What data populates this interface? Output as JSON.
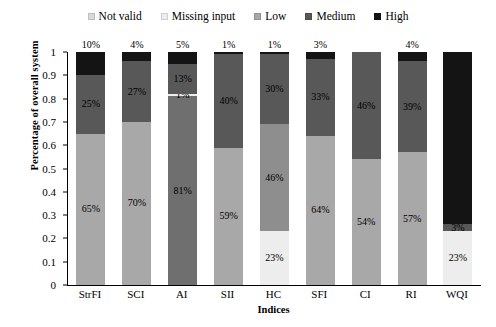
{
  "chart_data": {
    "type": "bar",
    "subtype": "stacked-column-100",
    "title": "",
    "xlabel": "Indices",
    "ylabel": "Percentage of overall system",
    "ylim": [
      0,
      1
    ],
    "ytick_labels": [
      "0",
      "0.1",
      "0.2",
      "0.3",
      "0.4",
      "0.5",
      "0.6",
      "0.7",
      "0.8",
      "0.9",
      "1"
    ],
    "ytick_values": [
      0,
      0.1,
      0.2,
      0.3,
      0.4,
      0.5,
      0.6,
      0.7,
      0.8,
      0.9,
      1
    ],
    "grid": false,
    "legend_position": "top-center",
    "categories": [
      "StrFI",
      "SCI",
      "AI",
      "SII",
      "HC",
      "SFI",
      "CI",
      "RI",
      "WQI"
    ],
    "series": [
      {
        "name": "Not valid",
        "color": "#d9d9d9",
        "values": [
          0,
          0,
          0,
          0,
          0,
          0,
          0,
          0,
          0
        ]
      },
      {
        "name": "Missing input",
        "color": "#ededed",
        "values": [
          0,
          0,
          1,
          0,
          23,
          0,
          0,
          0,
          23
        ]
      },
      {
        "name": "Low",
        "color": "#a8a8a8",
        "values": [
          65,
          70,
          81,
          59,
          46,
          64,
          54,
          57,
          0
        ]
      },
      {
        "name": "Medium",
        "color": "#585858",
        "values": [
          25,
          27,
          13,
          40,
          30,
          33,
          46,
          39,
          3
        ]
      },
      {
        "name": "High",
        "color": "#141414",
        "values": [
          10,
          4,
          5,
          1,
          1,
          3,
          0,
          4,
          74
        ]
      }
    ],
    "bars": [
      {
        "category": "StrFI",
        "top_label": "10%",
        "segments": [
          {
            "series": "Low",
            "value": 65,
            "label": "65%",
            "color": "#a8a8a8",
            "label_color": "dark"
          },
          {
            "series": "Medium",
            "value": 25,
            "label": "25%",
            "color": "#585858",
            "label_color": "dark"
          },
          {
            "series": "High",
            "value": 10,
            "label": "",
            "color": "#141414",
            "label_color": "onblack"
          }
        ]
      },
      {
        "category": "SCI",
        "top_label": "4%",
        "segments": [
          {
            "series": "Low",
            "value": 70,
            "label": "70%",
            "color": "#a8a8a8",
            "label_color": "dark"
          },
          {
            "series": "Medium",
            "value": 26,
            "label": "27%",
            "color": "#585858",
            "label_color": "dark"
          },
          {
            "series": "High",
            "value": 4,
            "label": "",
            "color": "#141414",
            "label_color": "onblack"
          }
        ]
      },
      {
        "category": "AI",
        "top_label": "5%",
        "segments": [
          {
            "series": "Low",
            "value": 81,
            "label": "81%",
            "color": "#6f6f6f",
            "label_color": "dark"
          },
          {
            "series": "Missing input",
            "value": 1,
            "label": "1%",
            "color": "#ededed",
            "label_color": "dark"
          },
          {
            "series": "Medium",
            "value": 13,
            "label": "13%",
            "color": "#585858",
            "label_color": "dark"
          },
          {
            "series": "High",
            "value": 5,
            "label": "",
            "color": "#141414",
            "label_color": "onblack"
          }
        ]
      },
      {
        "category": "SII",
        "top_label": "1%",
        "segments": [
          {
            "series": "Low",
            "value": 59,
            "label": "59%",
            "color": "#a8a8a8",
            "label_color": "dark"
          },
          {
            "series": "Medium",
            "value": 40,
            "label": "40%",
            "color": "#585858",
            "label_color": "dark"
          },
          {
            "series": "High",
            "value": 1,
            "label": "",
            "color": "#141414",
            "label_color": "onblack"
          }
        ]
      },
      {
        "category": "HC",
        "top_label": "1%",
        "segments": [
          {
            "series": "Missing input",
            "value": 23,
            "label": "23%",
            "color": "#ededed",
            "label_color": "dark"
          },
          {
            "series": "Low",
            "value": 46,
            "label": "46%",
            "color": "#8e8e8e",
            "label_color": "dark"
          },
          {
            "series": "Medium",
            "value": 30,
            "label": "30%",
            "color": "#585858",
            "label_color": "dark"
          },
          {
            "series": "High",
            "value": 1,
            "label": "",
            "color": "#141414",
            "label_color": "onblack"
          }
        ]
      },
      {
        "category": "SFI",
        "top_label": "3%",
        "segments": [
          {
            "series": "Low",
            "value": 64,
            "label": "64%",
            "color": "#a8a8a8",
            "label_color": "dark"
          },
          {
            "series": "Medium",
            "value": 33,
            "label": "33%",
            "color": "#585858",
            "label_color": "dark"
          },
          {
            "series": "High",
            "value": 3,
            "label": "",
            "color": "#141414",
            "label_color": "onblack"
          }
        ]
      },
      {
        "category": "CI",
        "top_label": "",
        "segments": [
          {
            "series": "Low",
            "value": 54,
            "label": "54%",
            "color": "#a8a8a8",
            "label_color": "dark"
          },
          {
            "series": "Medium",
            "value": 46,
            "label": "46%",
            "color": "#585858",
            "label_color": "dark"
          }
        ]
      },
      {
        "category": "RI",
        "top_label": "4%",
        "segments": [
          {
            "series": "Low",
            "value": 57,
            "label": "57%",
            "color": "#a8a8a8",
            "label_color": "dark"
          },
          {
            "series": "Medium",
            "value": 39,
            "label": "39%",
            "color": "#585858",
            "label_color": "dark"
          },
          {
            "series": "High",
            "value": 4,
            "label": "",
            "color": "#141414",
            "label_color": "onblack"
          }
        ]
      },
      {
        "category": "WQI",
        "top_label": "",
        "segments": [
          {
            "series": "Missing input",
            "value": 23,
            "label": "23%",
            "color": "#ededed",
            "label_color": "dark"
          },
          {
            "series": "Medium",
            "value": 3,
            "label": "3%",
            "color": "#585858",
            "label_color": "dark"
          },
          {
            "series": "High",
            "value": 74,
            "label": "74%",
            "color": "#141414",
            "label_color": "onblack"
          }
        ]
      }
    ]
  },
  "legend": {
    "items": [
      {
        "label": "Not valid",
        "color": "#d9d9d9"
      },
      {
        "label": "Missing input",
        "color": "#ededed"
      },
      {
        "label": "Low",
        "color": "#a8a8a8"
      },
      {
        "label": "Medium",
        "color": "#585858"
      },
      {
        "label": "High",
        "color": "#141414"
      }
    ]
  },
  "axes": {
    "y_title": "Percentage of overall system",
    "x_title": "Indices"
  }
}
